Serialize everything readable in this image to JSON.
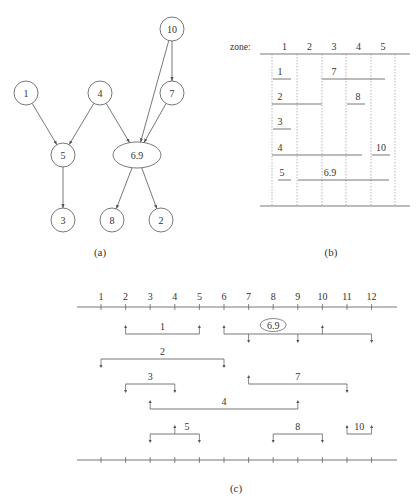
{
  "panel_a": {
    "caption": "(a)",
    "nodes": [
      {
        "id": "10",
        "label": "10",
        "x": 172,
        "y": 29,
        "shape": "circle"
      },
      {
        "id": "1",
        "label": "1",
        "x": 26,
        "y": 93,
        "shape": "circle"
      },
      {
        "id": "4",
        "label": "4",
        "x": 100,
        "y": 93,
        "shape": "circle"
      },
      {
        "id": "7",
        "label": "7",
        "x": 172,
        "y": 93,
        "shape": "circle"
      },
      {
        "id": "5",
        "label": "5",
        "x": 63,
        "y": 155,
        "shape": "circle"
      },
      {
        "id": "6.9",
        "label": "6.9",
        "x": 137,
        "y": 155,
        "shape": "ellipse"
      },
      {
        "id": "3",
        "label": "3",
        "x": 63,
        "y": 220,
        "shape": "circle"
      },
      {
        "id": "8",
        "label": "8",
        "x": 112,
        "y": 220,
        "shape": "circle"
      },
      {
        "id": "2",
        "label": "2",
        "x": 161,
        "y": 220,
        "shape": "circle"
      }
    ],
    "edges": [
      [
        "10",
        "7"
      ],
      [
        "10",
        "6.9"
      ],
      [
        "1",
        "5"
      ],
      [
        "4",
        "5"
      ],
      [
        "4",
        "6.9"
      ],
      [
        "7",
        "6.9"
      ],
      [
        "5",
        "3"
      ],
      [
        "6.9",
        "8"
      ],
      [
        "6.9",
        "2"
      ]
    ]
  },
  "panel_b": {
    "caption": "(b)",
    "zone_label": "zone:",
    "zones": [
      "1",
      "2",
      "3",
      "4",
      "5"
    ],
    "rows": [
      {
        "items": [
          {
            "label": "1",
            "from_col": 0,
            "to_col": 0
          },
          {
            "label": "7",
            "from_col": 2,
            "to_col": 4
          }
        ]
      },
      {
        "items": [
          {
            "label": "2",
            "from_col": 0,
            "to_col": 1
          },
          {
            "label": "8",
            "from_col": 3,
            "to_col": 3
          }
        ]
      },
      {
        "items": [
          {
            "label": "3",
            "from_col": 0,
            "to_col": 0
          }
        ]
      },
      {
        "items": [
          {
            "label": "4",
            "from_col": 0,
            "to_col": 3
          },
          {
            "label": "10",
            "from_col": 4,
            "to_col": 4
          }
        ]
      },
      {
        "items": [
          {
            "label": "5",
            "from_col": 0,
            "to_col": 0
          },
          {
            "label": "6.9",
            "from_col": 1,
            "to_col": 4
          }
        ]
      }
    ]
  },
  "panel_c": {
    "caption": "(c)",
    "ticks": [
      "1",
      "2",
      "3",
      "4",
      "5",
      "6",
      "7",
      "8",
      "9",
      "10",
      "11",
      "12"
    ],
    "intervals": [
      {
        "label": "1",
        "start": 2,
        "end": 5,
        "row": 0,
        "label_at": 3.5,
        "markers": [
          {
            "pos": 2,
            "dir": "up"
          },
          {
            "pos": 5,
            "dir": "up"
          }
        ]
      },
      {
        "label": "6.9",
        "start": 6,
        "end": 12,
        "row": 0,
        "label_at": 8,
        "circled": true,
        "markers": [
          {
            "pos": 6,
            "dir": "up"
          },
          {
            "pos": 10,
            "dir": "up"
          },
          {
            "pos": 7,
            "dir": "down"
          },
          {
            "pos": 9,
            "dir": "down"
          },
          {
            "pos": 12,
            "dir": "down"
          }
        ]
      },
      {
        "label": "2",
        "start": 1,
        "end": 6,
        "row": 1,
        "label_at": 3.5,
        "markers": [
          {
            "pos": 1,
            "dir": "down"
          },
          {
            "pos": 6,
            "dir": "down"
          }
        ]
      },
      {
        "label": "3",
        "start": 2,
        "end": 4,
        "row": 2,
        "label_at": 3,
        "markers": [
          {
            "pos": 2,
            "dir": "down"
          },
          {
            "pos": 4,
            "dir": "down"
          }
        ]
      },
      {
        "label": "7",
        "start": 7,
        "end": 11,
        "row": 2,
        "label_at": 9,
        "markers": [
          {
            "pos": 7,
            "dir": "up"
          },
          {
            "pos": 11,
            "dir": "down"
          }
        ]
      },
      {
        "label": "4",
        "start": 3,
        "end": 9,
        "row": 3,
        "label_at": 6,
        "markers": [
          {
            "pos": 3,
            "dir": "up"
          },
          {
            "pos": 9,
            "dir": "up"
          }
        ]
      },
      {
        "label": "5",
        "start": 3,
        "end": 5,
        "row": 4,
        "label_at": 4.5,
        "markers": [
          {
            "pos": 4,
            "dir": "up"
          },
          {
            "pos": 3,
            "dir": "down"
          },
          {
            "pos": 5,
            "dir": "down"
          }
        ]
      },
      {
        "label": "8",
        "start": 8,
        "end": 10,
        "row": 4,
        "label_at": 9,
        "markers": [
          {
            "pos": 8,
            "dir": "down"
          },
          {
            "pos": 10,
            "dir": "down"
          }
        ]
      },
      {
        "label": "10",
        "start": 11,
        "end": 12,
        "row": 4,
        "label_at": 11.5,
        "markers": [
          {
            "pos": 11,
            "dir": "up"
          },
          {
            "pos": 12,
            "dir": "up"
          }
        ]
      }
    ]
  }
}
